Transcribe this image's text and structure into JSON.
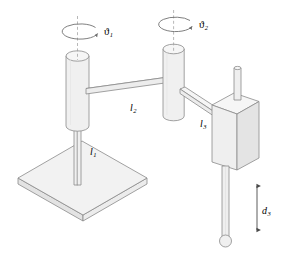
{
  "figure": {
    "background_color": "#ffffff",
    "outline_color": "#8a8a8a",
    "fill_color": "#f1f1f1",
    "fill_color_light": "#f7f7f7",
    "fill_color_dark": "#e6e6e6",
    "label_color": "#1a1a1a",
    "axis_color": "#9a9a9a"
  },
  "labels": {
    "theta1": {
      "symbol": "ϑ",
      "subscript": "1",
      "full": "ϑ1"
    },
    "theta2": {
      "symbol": "ϑ",
      "subscript": "2",
      "full": "ϑ2"
    },
    "l1": {
      "symbol": "l",
      "subscript": "1",
      "full": "l1"
    },
    "l2": {
      "symbol": "l",
      "subscript": "2",
      "full": "l2"
    },
    "l3": {
      "symbol": "l",
      "subscript": "3",
      "full": "l3"
    },
    "d3": {
      "symbol": "d",
      "subscript": "3",
      "full": "d3"
    }
  },
  "parts": {
    "base_plate": "base-plate",
    "column_rod": "vertical-column-rod",
    "joint1_cylinder": "revolute-joint-1-cylinder",
    "link2_arm": "link-2-horizontal-arm",
    "joint2_cylinder": "revolute-joint-2-cylinder",
    "link3_arm": "link-3-arm",
    "prismatic_housing": "prismatic-joint-housing",
    "prismatic_rod": "prismatic-joint-rod",
    "end_effector": "end-effector-ball"
  },
  "annotations": {
    "rotation_1": "rotation-arrow-joint-1",
    "rotation_2": "rotation-arrow-joint-2",
    "axis_1": "rotation-axis-1",
    "axis_2": "rotation-axis-2",
    "dimension_d3": "prismatic-displacement-dimension"
  }
}
